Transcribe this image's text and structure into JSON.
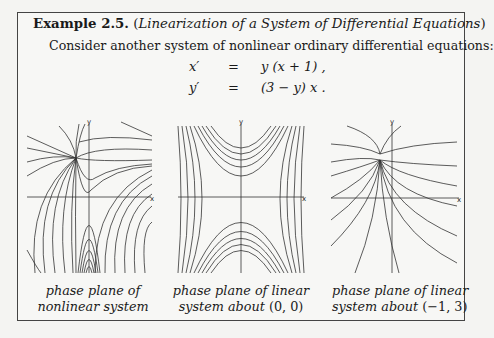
{
  "example": {
    "label": "Example 2.5.",
    "title": "Linearization of a System of Differential Equations",
    "intro": "Consider another system of nonlinear ordinary differential equations:"
  },
  "equations": [
    {
      "lhs": "x′",
      "eq": "=",
      "rhs": "y (x + 1) ,"
    },
    {
      "lhs": "y′",
      "eq": "=",
      "rhs": "(3 − y) x ."
    }
  ],
  "plots": [
    {
      "name": "nonlinear",
      "caption_line1": "phase plane of",
      "caption_line2": "nonlinear system",
      "x_axis_label": "x",
      "y_axis_label": "y"
    },
    {
      "name": "linear-origin",
      "caption_line1": "phase plane of linear",
      "caption_line2_text": "system about",
      "caption_line2_point": "(0, 0)",
      "x_axis_label": "x",
      "y_axis_label": "y"
    },
    {
      "name": "linear-minus1-3",
      "caption_line1": "phase plane of linear",
      "caption_line2_text": "system about",
      "caption_line2_point": "(−1, 3)",
      "x_axis_label": "x",
      "y_axis_label": "y"
    }
  ],
  "colors": {
    "ink": "#1a1a1a",
    "curve": "#333333",
    "border": "#444444",
    "paper": "#f7f7f5"
  }
}
